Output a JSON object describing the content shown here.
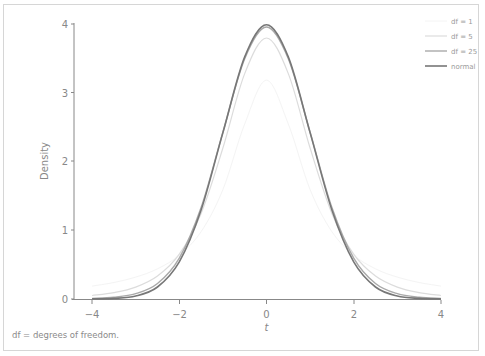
{
  "chart_data": {
    "type": "line",
    "title": "",
    "xlabel": "t",
    "ylabel": "Density",
    "xlim": [
      -4,
      4
    ],
    "ylim": [
      0,
      4
    ],
    "grid": false,
    "legend_position": "top-right",
    "x_ticks": [
      "−4",
      "−2",
      "0",
      "2",
      "4"
    ],
    "y_ticks": [
      "0",
      "1",
      "2",
      "3",
      "4"
    ],
    "x": [
      -4,
      -3.5,
      -3,
      -2.5,
      -2,
      -1.5,
      -1,
      -0.5,
      0,
      0.5,
      1,
      1.5,
      2,
      2.5,
      3,
      3.5,
      4
    ],
    "series": [
      {
        "name": "df = 1",
        "color": "#f4f4f4",
        "width": 1,
        "values": [
          0.187,
          0.24,
          0.318,
          0.439,
          0.637,
          0.979,
          1.592,
          2.546,
          3.183,
          2.546,
          1.592,
          0.979,
          0.637,
          0.439,
          0.318,
          0.24,
          0.187
        ]
      },
      {
        "name": "df = 5",
        "color": "#dcdcdc",
        "width": 1.2,
        "values": [
          0.051,
          0.093,
          0.173,
          0.333,
          0.651,
          1.245,
          2.197,
          3.279,
          3.796,
          3.279,
          2.197,
          1.245,
          0.651,
          0.333,
          0.173,
          0.093,
          0.051
        ]
      },
      {
        "name": "df = 25",
        "color": "#a9a9a9",
        "width": 1.4,
        "values": [
          0.009,
          0.025,
          0.077,
          0.225,
          0.595,
          1.33,
          2.426,
          3.496,
          3.956,
          3.496,
          2.426,
          1.33,
          0.595,
          0.225,
          0.077,
          0.025,
          0.009
        ]
      },
      {
        "name": "normal",
        "color": "#777777",
        "width": 1.6,
        "values": [
          0.001,
          0.009,
          0.044,
          0.175,
          0.54,
          1.295,
          2.42,
          3.521,
          3.989,
          3.521,
          2.42,
          1.295,
          0.54,
          0.175,
          0.044,
          0.009,
          0.001
        ]
      }
    ],
    "annotations": [
      "df = degrees of freedom."
    ]
  },
  "caption": "df = degrees of freedom.",
  "legend": [
    {
      "label": "df = 1"
    },
    {
      "label": "df = 5"
    },
    {
      "label": "df = 25"
    },
    {
      "label": "normal"
    }
  ],
  "axes": {
    "xlabel": "t",
    "ylabel": "Density",
    "x_ticks": [
      "−4",
      "−2",
      "0",
      "2",
      "4"
    ],
    "y_ticks": [
      "0",
      "1",
      "2",
      "3",
      "4"
    ]
  }
}
